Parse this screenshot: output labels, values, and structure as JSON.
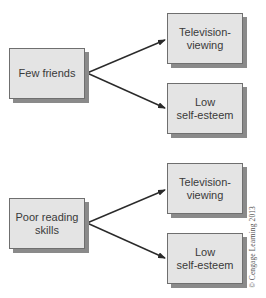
{
  "diagram": {
    "colors": {
      "box_fill": "#e4e4e4",
      "box_border": "#6f6f6f",
      "box_shadow": "#8a8a8a",
      "text": "#3a3a3a",
      "arrow": "#2a2a2a"
    },
    "groups": [
      {
        "source": {
          "line1": "Few friends",
          "line2": ""
        },
        "targets": [
          {
            "line1": "Television-",
            "line2": "viewing"
          },
          {
            "line1": "Low",
            "line2": "self-esteem"
          }
        ]
      },
      {
        "source": {
          "line1": "Poor reading",
          "line2": "skills"
        },
        "targets": [
          {
            "line1": "Television-",
            "line2": "viewing"
          },
          {
            "line1": "Low",
            "line2": "self-esteem"
          }
        ]
      }
    ],
    "edges": [
      {
        "from": "Few friends",
        "to": "Television-viewing"
      },
      {
        "from": "Few friends",
        "to": "Low self-esteem"
      },
      {
        "from": "Poor reading skills",
        "to": "Television-viewing"
      },
      {
        "from": "Poor reading skills",
        "to": "Low self-esteem"
      }
    ],
    "credit": "© Cengage Learning 2013"
  }
}
